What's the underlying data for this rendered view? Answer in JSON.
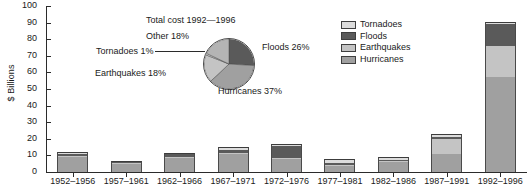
{
  "chart_data": {
    "type": "bar",
    "title": "",
    "xlabel": "",
    "ylabel": "$ Billions",
    "ylim": [
      0,
      100
    ],
    "yticks": [
      0,
      10,
      20,
      30,
      40,
      50,
      60,
      70,
      80,
      90,
      100
    ],
    "grid": false,
    "stacked": true,
    "legend_position": "upper-right",
    "categories": [
      "1952–1956",
      "1957–1961",
      "1962–1966",
      "1967–1971",
      "1972–1976",
      "1977–1981",
      "1982–1986",
      "1987–1991",
      "1992–1996"
    ],
    "series": [
      {
        "name": "Hurricanes",
        "color": "#a0a0a0",
        "values": [
          9.2,
          4.6,
          8.7,
          11.0,
          8.0,
          3.4,
          6.0,
          11.0,
          57.0
        ]
      },
      {
        "name": "Earthquakes",
        "color": "#c4c4c4",
        "values": [
          0.3,
          0.2,
          0.4,
          0.6,
          0.5,
          0.4,
          0.4,
          9.0,
          19.0
        ]
      },
      {
        "name": "Floods",
        "color": "#5a5a5a",
        "values": [
          1.2,
          0.4,
          1.3,
          1.8,
          7.0,
          1.4,
          0.8,
          1.4,
          13.0
        ]
      },
      {
        "name": "Tornadoes",
        "color": "#dcdcdc",
        "values": [
          1.3,
          0.6,
          1.1,
          1.4,
          1.5,
          2.3,
          1.6,
          1.8,
          1.2
        ]
      }
    ],
    "totals": [
      12.0,
      5.8,
      11.5,
      14.8,
      17.0,
      7.5,
      8.8,
      23.2,
      90.2
    ],
    "inset_pie": {
      "type": "pie",
      "title": "Total cost 1992—1996",
      "slices": [
        {
          "label": "Floods 26%",
          "name": "Floods",
          "value": 26,
          "color": "#5a5a5a"
        },
        {
          "label": "Hurricanes 37%",
          "name": "Hurricanes",
          "value": 37,
          "color": "#a0a0a0"
        },
        {
          "label": "Earthquakes 18%",
          "name": "Earthquakes",
          "value": 18,
          "color": "#c4c4c4"
        },
        {
          "label": "Tornadoes 1%",
          "name": "Tornadoes",
          "value": 1,
          "color": "#dcdcdc"
        },
        {
          "label": "Other 18%",
          "name": "Other",
          "value": 18,
          "color": "#b4b4b4"
        }
      ]
    }
  },
  "legend": {
    "items": [
      {
        "label": "Tornadoes",
        "color": "#dcdcdc"
      },
      {
        "label": "Floods",
        "color": "#5a5a5a"
      },
      {
        "label": "Earthquakes",
        "color": "#c4c4c4"
      },
      {
        "label": "Hurricanes",
        "color": "#a0a0a0"
      }
    ]
  }
}
